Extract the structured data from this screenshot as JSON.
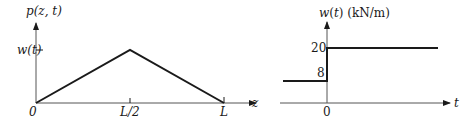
{
  "left_diagram": {
    "y_axis_label": "p(z, t)",
    "x_axis_label": "z",
    "y_tick_label": "w(t)",
    "x_ticks": [
      "0",
      "L/2",
      "L"
    ],
    "shape": "triangular distributed load",
    "points": [
      {
        "z": "0",
        "p": 0
      },
      {
        "z": "L/2",
        "p": "w(t)"
      },
      {
        "z": "L",
        "p": 0
      }
    ]
  },
  "right_diagram": {
    "y_axis_label": "w(t) (kN/m)",
    "x_axis_label": "t",
    "y_ticks": [
      "20",
      "8"
    ],
    "x_ticks": [
      "0"
    ],
    "shape": "step function",
    "segments": [
      {
        "t_range": "t < 0",
        "w": 8
      },
      {
        "t_range": "t >= 0",
        "w": 20
      }
    ]
  },
  "colors": {
    "line": "#1a1a1a",
    "axis": "#555555",
    "background": "#ffffff"
  }
}
